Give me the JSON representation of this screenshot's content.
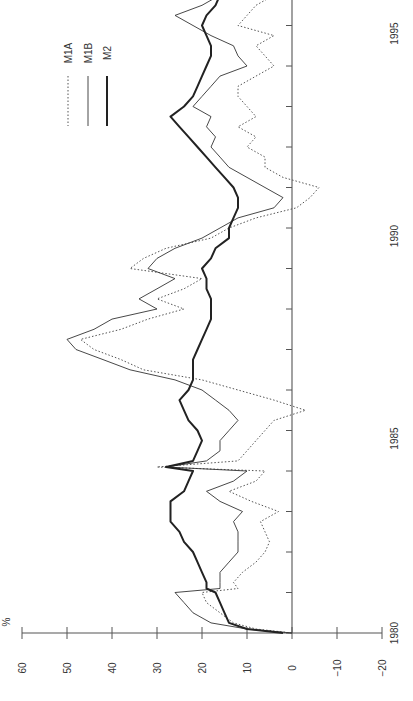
{
  "chart_data": {
    "type": "line",
    "orientation": "rotated-90-ccw",
    "title": "",
    "xlabel": "",
    "ylabel": "%",
    "ylim": [
      -20,
      60
    ],
    "yticks": [
      60,
      50,
      40,
      30,
      20,
      10,
      0,
      -10,
      -20
    ],
    "ytick_labels": [
      "60",
      "50",
      "40",
      "30",
      "20",
      "10",
      "0",
      "−10",
      "−20"
    ],
    "xlim": [
      1980,
      1996.2
    ],
    "xticks": [
      1980,
      1985,
      1990,
      1995
    ],
    "xtick_labels": [
      "1980",
      "1985",
      "1990",
      "1995"
    ],
    "grid": false,
    "zero_line": true,
    "legend": {
      "position": "upper-left (rotated)",
      "entries": [
        {
          "name": "M1A",
          "style": "dotted"
        },
        {
          "name": "M1B",
          "style": "thin-solid"
        },
        {
          "name": "M2",
          "style": "thick-solid"
        }
      ]
    },
    "x": [
      1980.0,
      1980.1,
      1980.25,
      1980.5,
      1980.75,
      1981.0,
      1981.1,
      1981.25,
      1981.5,
      1981.75,
      1982.0,
      1982.25,
      1982.5,
      1982.75,
      1983.0,
      1983.25,
      1983.5,
      1983.75,
      1984.0,
      1984.1,
      1984.25,
      1984.5,
      1984.75,
      1985.0,
      1985.25,
      1985.5,
      1985.75,
      1986.0,
      1986.25,
      1986.5,
      1986.75,
      1987.0,
      1987.25,
      1987.5,
      1987.75,
      1988.0,
      1988.25,
      1988.5,
      1988.75,
      1989.0,
      1989.25,
      1989.5,
      1989.75,
      1990.0,
      1990.25,
      1990.5,
      1990.75,
      1991.0,
      1991.25,
      1991.5,
      1991.75,
      1992.0,
      1992.25,
      1992.5,
      1992.75,
      1993.0,
      1993.25,
      1993.5,
      1993.75,
      1994.0,
      1994.25,
      1994.5,
      1994.75,
      1995.0,
      1995.25,
      1995.5,
      1995.75,
      1996.0,
      1996.2
    ],
    "series": [
      {
        "name": "M1A",
        "values": [
          0,
          8,
          13,
          16,
          19,
          20,
          12,
          13,
          11,
          8,
          6,
          5,
          6,
          7,
          3,
          9,
          14,
          8,
          6,
          30,
          12,
          10,
          8,
          6,
          4,
          -3,
          4,
          12,
          20,
          33,
          38,
          44,
          47,
          38,
          32,
          24,
          30,
          24,
          20,
          36,
          33,
          28,
          18,
          14,
          8,
          -1,
          -4,
          -6,
          2,
          6,
          6,
          10,
          8,
          12,
          8,
          10,
          12,
          12,
          8,
          4,
          6,
          8,
          4,
          12,
          10,
          8,
          4,
          -7,
          -2
        ]
      },
      {
        "name": "M1B",
        "values": [
          0,
          10,
          18,
          22,
          24,
          26,
          16,
          16,
          16,
          14,
          12,
          12,
          12,
          13,
          11,
          16,
          19,
          13,
          10,
          28,
          19,
          16,
          16,
          14,
          12,
          14,
          17,
          20,
          26,
          36,
          42,
          48,
          50,
          44,
          40,
          30,
          34,
          30,
          26,
          32,
          30,
          26,
          20,
          16,
          12,
          4,
          2,
          6,
          10,
          14,
          16,
          18,
          17,
          19,
          18,
          22,
          20,
          18,
          16,
          10,
          12,
          13,
          18,
          22,
          26,
          20,
          16,
          0,
          4
        ]
      },
      {
        "name": "M2",
        "values": [
          2,
          10,
          14,
          15,
          16,
          17,
          19,
          19,
          20,
          21,
          22,
          24,
          25,
          27,
          27,
          27,
          24,
          23,
          22,
          28,
          22,
          21,
          20,
          21,
          23,
          24,
          25,
          23,
          22,
          22,
          22,
          21,
          20,
          19,
          18,
          18,
          18,
          19,
          19,
          20,
          18,
          17,
          14,
          14,
          13,
          12,
          12,
          13,
          15,
          17,
          19,
          21,
          23,
          25,
          27,
          24,
          22,
          21,
          20,
          19,
          18,
          18,
          19,
          20,
          19,
          17,
          16,
          14,
          14
        ]
      }
    ]
  },
  "legend": {
    "items": [
      {
        "label": "M1A"
      },
      {
        "label": "M1B"
      },
      {
        "label": "M2"
      }
    ]
  },
  "axis": {
    "unit_label": "%"
  }
}
